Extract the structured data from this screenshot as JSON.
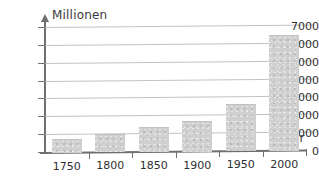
{
  "chart_data": {
    "type": "bar",
    "title": "",
    "subtitle": "",
    "xlabel": "Jahr",
    "ylabel": "Millionen",
    "categories": [
      "1750",
      "1800",
      "1850",
      "1900",
      "1950",
      "2000"
    ],
    "values": [
      700,
      950,
      1350,
      1650,
      2600,
      6450
    ],
    "series": [
      {
        "name": "Weltbevölkerung",
        "values": [
          700,
          950,
          1350,
          1650,
          2600,
          6450
        ]
      }
    ],
    "ylim": [
      0,
      7000
    ],
    "ytick_labels": [
      "0",
      "1000",
      "2000",
      "3000",
      "4000",
      "5000",
      "6000",
      "7000"
    ],
    "ytick_values": [
      0,
      1000,
      2000,
      3000,
      4000,
      5000,
      6000,
      7000
    ],
    "xtick_labels": [
      "1750",
      "1800",
      "1850",
      "1900",
      "1950",
      "2000"
    ],
    "grid": true,
    "legend": false,
    "legend_position": "none",
    "bar_color": "#cfcfcf",
    "axis_color": "#6f6f6f",
    "grid_color": "#b9b9b9",
    "text_color": "#2e2e2e"
  }
}
